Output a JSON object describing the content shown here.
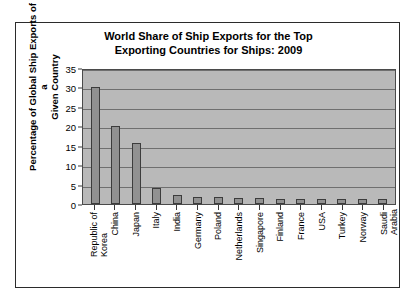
{
  "chart_data": {
    "type": "bar",
    "title": "World Share of Ship Exports for the Top Exporting Countries for Ships: 2009",
    "title_line1": "World Share of Ship Exports for the Top",
    "title_line2": "Exporting Countries for Ships: 2009",
    "xlabel": "",
    "ylabel": "Percentage of Global Ship Exports of a Given Country",
    "ylabel_line1": "Percentage of Global Ship Exports of a",
    "ylabel_line2": "Given Country",
    "ylim": [
      0,
      35
    ],
    "ytick_labels": [
      "0",
      "5",
      "10",
      "15",
      "20",
      "25",
      "30",
      "35"
    ],
    "ytick_values": [
      0,
      5,
      10,
      15,
      20,
      25,
      30,
      35
    ],
    "grid": true,
    "legend": false,
    "categories": [
      "Republic of Korea",
      "China",
      "Japan",
      "Italy",
      "India",
      "Germany",
      "Poland",
      "Netherlands",
      "Singapore",
      "Finland",
      "France",
      "USA",
      "Turkey",
      "Norway",
      "Saudi Arabia"
    ],
    "category_lines": [
      [
        "Republic of",
        "Korea"
      ],
      [
        "China",
        ""
      ],
      [
        "Japan",
        ""
      ],
      [
        "Italy",
        ""
      ],
      [
        "India",
        ""
      ],
      [
        "Germany",
        ""
      ],
      [
        "Poland",
        ""
      ],
      [
        "Netherlands",
        ""
      ],
      [
        "Singapore",
        ""
      ],
      [
        "Finland",
        ""
      ],
      [
        "France",
        ""
      ],
      [
        "USA",
        ""
      ],
      [
        "Turkey",
        ""
      ],
      [
        "Norway",
        ""
      ],
      [
        "Saudi",
        "Arabia"
      ]
    ],
    "values": [
      30.2,
      20.1,
      15.7,
      4.1,
      2.2,
      1.8,
      1.8,
      1.5,
      1.5,
      1.4,
      1.4,
      1.3,
      1.3,
      1.2,
      1.2
    ],
    "colors": {
      "bar_fill": "#919191",
      "bar_edge": "#3c3c3c",
      "plot_background": "#b9b9b9",
      "gridline": "#6f6f6f",
      "axis": "#3a3a3a",
      "text": "#000000",
      "figure_border": "#2b2b2b"
    }
  }
}
